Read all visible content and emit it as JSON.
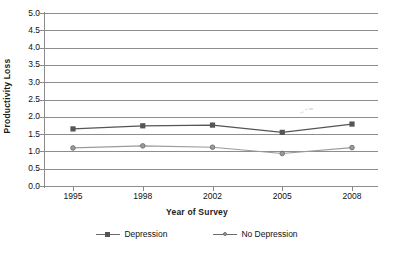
{
  "chart_data": {
    "type": "line",
    "title": "",
    "xlabel": "Year of Survey",
    "ylabel": "Productivity Loss",
    "categories": [
      "1995",
      "1998",
      "2002",
      "2005",
      "2008"
    ],
    "x": [
      1995,
      1998,
      2002,
      2005,
      2008
    ],
    "series": [
      {
        "name": "Depression",
        "marker": "square",
        "color": "#555555",
        "values": [
          1.65,
          1.74,
          1.76,
          1.55,
          1.79
        ]
      },
      {
        "name": "No Depression",
        "marker": "circle",
        "color": "#9a9a9a",
        "values": [
          1.1,
          1.16,
          1.12,
          0.94,
          1.11
        ]
      }
    ],
    "ylim": [
      0.0,
      5.0
    ],
    "ytick_labels": [
      "5.0",
      "4.5",
      "4.0",
      "3.5",
      "3.0",
      "2.5",
      "2.0",
      "1.5",
      "1.0",
      "0.5",
      "0.0"
    ],
    "ytick_values": [
      5.0,
      4.5,
      4.0,
      3.5,
      3.0,
      2.5,
      2.0,
      1.5,
      1.0,
      0.5,
      0.0
    ],
    "grid": true,
    "legend_position": "bottom"
  },
  "colors": {
    "gridline": "#8d8d8d",
    "axis": "#8a8a8a",
    "series_depression": "#555555",
    "series_no_depression": "#9a9a9a",
    "text": "#111111",
    "background": "#ffffff"
  }
}
